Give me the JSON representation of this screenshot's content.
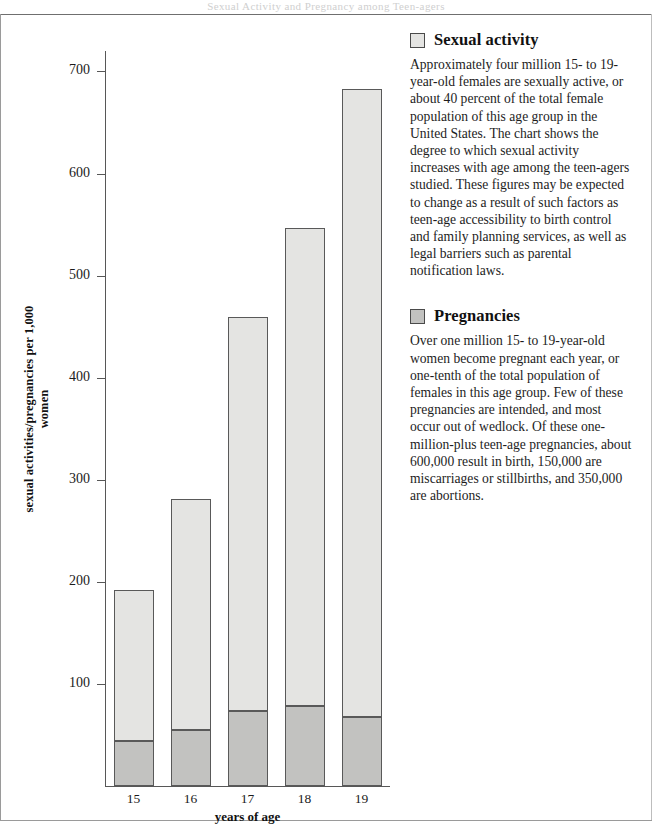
{
  "page": {
    "running_head": "Sexual Activity and Pregnancy among Teen-agers"
  },
  "chart_data": {
    "type": "bar",
    "subtype": "stacked-bar",
    "title": "",
    "xlabel": "years of age",
    "ylabel": "sexual activities/pregnancies per 1,000 women",
    "categories": [
      "15",
      "16",
      "17",
      "18",
      "19"
    ],
    "x_tick_labels": [
      "15",
      "16",
      "17",
      "18",
      "19"
    ],
    "y_tick_labels": [
      "100",
      "200",
      "300",
      "400",
      "500",
      "600",
      "700"
    ],
    "y_ticks": [
      100,
      200,
      300,
      400,
      500,
      600,
      700
    ],
    "ylim": [
      0,
      720
    ],
    "grid": false,
    "legend_position": "right",
    "stacked_totals": [
      191,
      280,
      458,
      546,
      682
    ],
    "series": [
      {
        "name": "Sexual activity",
        "color": "#e4e4e2",
        "values": [
          147,
          225,
          385,
          468,
          614
        ],
        "note": "upper segment of each stacked bar (total minus pregnancies)"
      },
      {
        "name": "Pregnancies",
        "color": "#c2c2c0",
        "values": [
          44,
          55,
          73,
          78,
          68
        ],
        "note": "lower segment of each stacked bar"
      }
    ]
  },
  "legend": [
    {
      "swatch_color": "#e4e4e2",
      "title": "Sexual activity",
      "body": "Approximately four million 15- to 19-year-old females are sexually active, or about 40 percent of the total female population of this age group in the United States. The chart shows the degree to which sexual activity increases with age among the teen-agers studied. These figures may be expected to change as a result of such factors as teen-age accessibility to birth control and family planning services, as well as legal barriers such as parental notification laws."
    },
    {
      "swatch_color": "#c2c2c0",
      "title": "Pregnancies",
      "body": "Over one million 15- to 19-year-old women become pregnant each year, or one-tenth of the total population of females in this age group. Few of these pregnancies are intended, and most occur out of wedlock. Of these one-million-plus teen-age pregnancies, about 600,000 result in birth, 150,000 are miscarriages or stillbirths, and 350,000 are abortions."
    }
  ],
  "colors": {
    "sexual_activity": "#e4e4e2",
    "pregnancies": "#c2c2c0",
    "axis": "#575757",
    "bar_outline": "#595959"
  }
}
